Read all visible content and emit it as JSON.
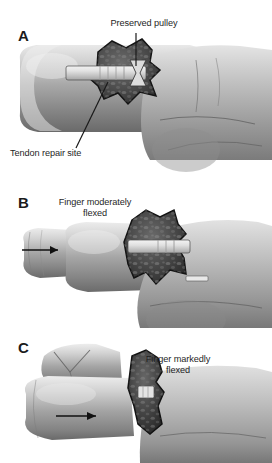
{
  "figure": {
    "background_color": "#ffffff",
    "ink_color": "#1f1f1f",
    "width": 272,
    "height": 463
  },
  "panels": [
    {
      "letter": "A",
      "annotations": [
        {
          "text": "Preserved pulley",
          "leader": "vertical-line"
        },
        {
          "text": "Tendon repair site",
          "leader": "diagonal-line"
        }
      ],
      "arrow": null,
      "description": "Finger extended with surgical window exposing tendon repair site and preserved pulley"
    },
    {
      "letter": "B",
      "annotations": [
        {
          "text": "Finger moderately\nflexed",
          "leader": "none"
        }
      ],
      "arrow": {
        "direction": "right",
        "label": "flexion-direction-arrow"
      },
      "description": "Finger moderately flexed, tendon repair migrated within window"
    },
    {
      "letter": "C",
      "annotations": [
        {
          "text": "Finger markedly\nflexed",
          "leader": "none"
        }
      ],
      "arrow": {
        "direction": "right",
        "label": "flexion-direction-arrow"
      },
      "description": "Finger markedly flexed, tendon repair drawn beneath the pulley"
    }
  ]
}
